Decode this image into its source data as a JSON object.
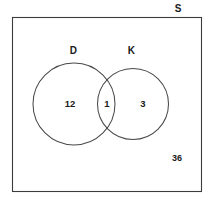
{
  "diagram": {
    "type": "venn-2-set",
    "universe": {
      "label": "S",
      "outside_count": "36"
    },
    "sets": [
      {
        "key": "D",
        "label": "D",
        "only_count": "12"
      },
      {
        "key": "K",
        "label": "K",
        "only_count": "3"
      }
    ],
    "intersection": {
      "label": "D and K",
      "count": "1"
    },
    "colors": {
      "background": "#ffffff",
      "rect_stroke": "#3c3c3c",
      "circle_stroke": "#4a4a4a",
      "text": "#1a1a1a"
    }
  }
}
